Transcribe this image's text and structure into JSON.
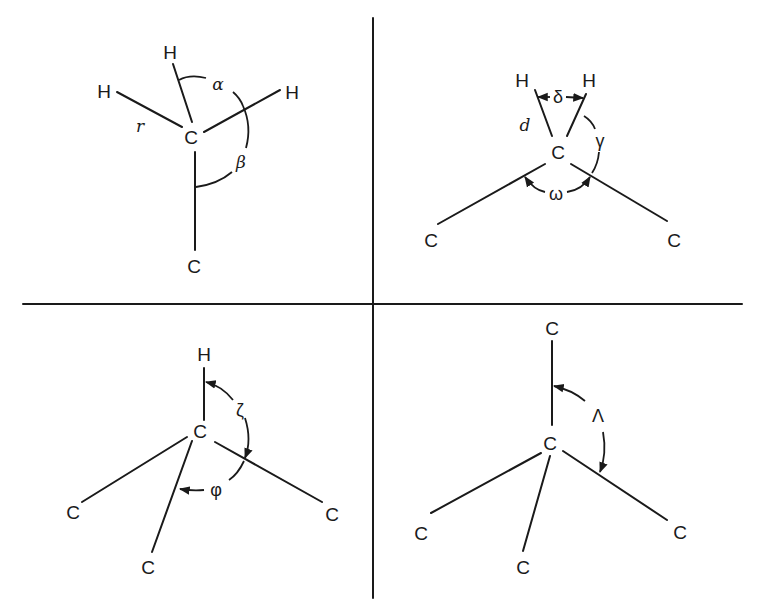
{
  "figure": {
    "panels": [
      {
        "id": "methyl",
        "atoms": {
          "center": "C",
          "h_left": "H",
          "h_top": "H",
          "h_right": "H",
          "c_bottom": "C"
        },
        "labels": {
          "bond_length": "r",
          "angle_hch": "α",
          "angle_hcc": "β"
        }
      },
      {
        "id": "methylene",
        "atoms": {
          "center": "C",
          "h_left": "H",
          "h_right": "H",
          "c_left": "C",
          "c_right": "C"
        },
        "labels": {
          "bond_length": "d",
          "angle_hch": "δ",
          "angle_hcc": "γ",
          "angle_ccc": "ω"
        }
      },
      {
        "id": "methine",
        "atoms": {
          "center": "C",
          "h_top": "H",
          "c_left": "C",
          "c_bottom": "C",
          "c_right": "C"
        },
        "labels": {
          "angle_hcc": "ζ",
          "angle_ccc": "φ"
        }
      },
      {
        "id": "quaternary",
        "atoms": {
          "center": "C",
          "c_top": "C",
          "c_left": "C",
          "c_bottom": "C",
          "c_right": "C"
        },
        "labels": {
          "angle_ccc": "Λ"
        }
      }
    ]
  }
}
